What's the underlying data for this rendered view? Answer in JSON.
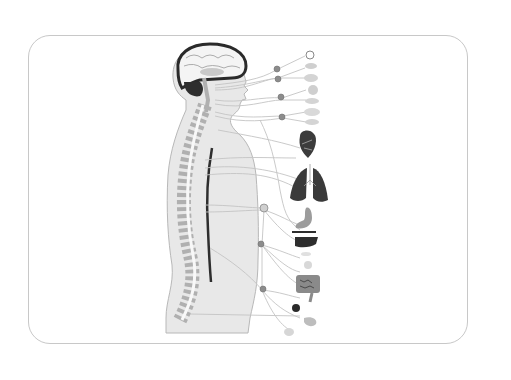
{
  "diagram": {
    "style": "grayscale",
    "colors": {
      "background": "#ffffff",
      "frame_border": "#c8c8c8",
      "body_fill": "#e6e6e6",
      "body_outline": "#b4b4b4",
      "brain_outline": "#2a2a2a",
      "spine": "#a8a8a8",
      "nerves": "#bdbdbd",
      "dark_organ": "#3c3c3c",
      "light_organ": "#cfcfcf",
      "ganglion": "#8c8c8c"
    },
    "organs": [
      {
        "name": "eye"
      },
      {
        "name": "lacrimal-gland"
      },
      {
        "name": "nasal-mucosa"
      },
      {
        "name": "salivary-gland-parotid"
      },
      {
        "name": "salivary-gland-submandibular"
      },
      {
        "name": "salivary-gland-sublingual"
      },
      {
        "name": "heart"
      },
      {
        "name": "lungs"
      },
      {
        "name": "stomach"
      },
      {
        "name": "pancreas"
      },
      {
        "name": "liver"
      },
      {
        "name": "gallbladder"
      },
      {
        "name": "kidney"
      },
      {
        "name": "intestines"
      },
      {
        "name": "rectum"
      },
      {
        "name": "bladder"
      },
      {
        "name": "genitals"
      }
    ]
  }
}
